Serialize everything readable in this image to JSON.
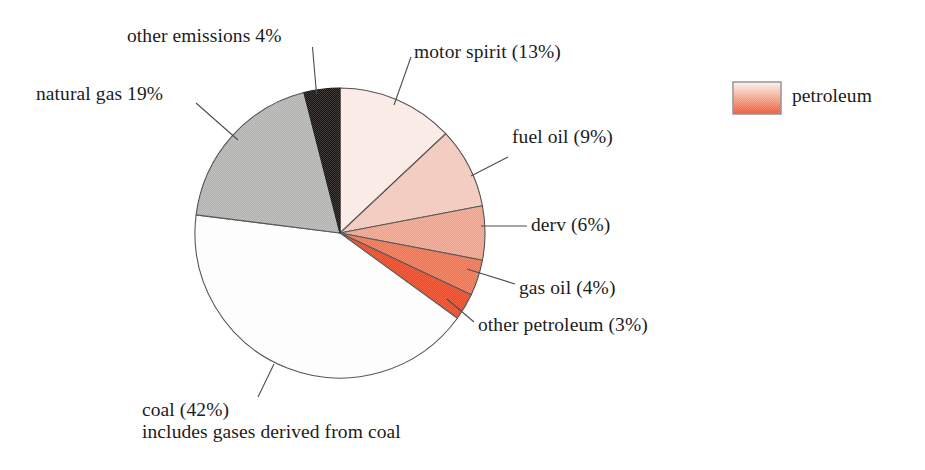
{
  "chart_data": {
    "type": "pie",
    "title": "",
    "subtitle": "",
    "xlabel": "",
    "ylabel": "",
    "legend_position": "right",
    "grid": false,
    "units": "percent",
    "start_angle_deg": 0,
    "direction": "clockwise",
    "categories": [
      "motor spirit",
      "fuel oil",
      "derv",
      "gas oil",
      "other petroleum",
      "coal",
      "natural gas",
      "other emissions"
    ],
    "values": [
      13,
      9,
      6,
      4,
      3,
      42,
      19,
      4
    ],
    "slices": [
      {
        "key": "motor-spirit",
        "name": "motor spirit",
        "value": 13,
        "label": "motor spirit (13%)",
        "group": "petroleum",
        "color": "#fbe9e4",
        "edge": "#4a4a4a"
      },
      {
        "key": "fuel-oil",
        "name": "fuel oil",
        "value": 9,
        "label": "fuel oil (9%)",
        "group": "petroleum",
        "color": "#f6c7b9",
        "edge": "#4a4a4a"
      },
      {
        "key": "derv",
        "name": "derv",
        "value": 6,
        "label": "derv (6%)",
        "group": "petroleum",
        "color": "#f1a189",
        "edge": "#4a4a4a"
      },
      {
        "key": "gas-oil",
        "name": "gas oil",
        "value": 4,
        "label": "gas oil (4%)",
        "group": "petroleum",
        "color": "#f4704b",
        "edge": "#4a4a4a"
      },
      {
        "key": "other-petroleum",
        "name": "other petroleum",
        "value": 3,
        "label": "other petroleum (3%)",
        "group": "petroleum",
        "color": "#f6421b",
        "edge": "#4a4a4a"
      },
      {
        "key": "coal",
        "name": "coal",
        "value": 42,
        "label": "coal (42%)",
        "note": "includes gases derived from coal",
        "group": "coal",
        "color": "#fdfdfc",
        "edge": "#55504c"
      },
      {
        "key": "natural-gas",
        "name": "natural gas",
        "value": 19,
        "label": "natural gas 19%",
        "group": "gas",
        "color": "#b2b2b0",
        "edge": "#4a4a4a"
      },
      {
        "key": "other-emissions",
        "name": "other emissions",
        "value": 4,
        "label": "other emissions 4%",
        "group": "other",
        "color": "#171311",
        "edge": "#171311"
      }
    ],
    "legend": [
      {
        "key": "petroleum",
        "label": "petroleum",
        "swatch_type": "gradient",
        "color_from": "#fdf2ee",
        "color_to": "#f4512a",
        "border_color": "#8a8a8a"
      }
    ]
  },
  "labels": {
    "other_emissions": "other emissions 4%",
    "natural_gas": "natural gas 19%",
    "motor_spirit": "motor spirit (13%)",
    "fuel_oil": "fuel oil (9%)",
    "derv": "derv (6%)",
    "gas_oil": "gas oil (4%)",
    "other_petroleum": "other petroleum (3%)",
    "coal": "coal (42%)",
    "coal_note": "includes gases derived from coal",
    "legend_petroleum": "petroleum"
  },
  "geometry": {
    "center_x": 340,
    "center_y": 233,
    "radius": 145
  }
}
